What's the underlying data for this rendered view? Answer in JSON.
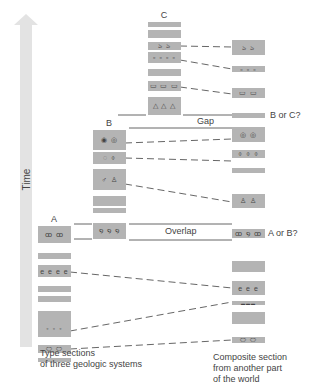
{
  "axis": {
    "time_label": "Time",
    "arrow_color": "#e3e3e3"
  },
  "colors": {
    "block": "#b4b4b4",
    "line": "#555555",
    "text": "#444444"
  },
  "columns": {
    "C": {
      "label": "C",
      "blocks": [
        {
          "top": 22,
          "height": 5,
          "fossil": ""
        },
        {
          "top": 30,
          "height": 8,
          "fossil": ""
        },
        {
          "top": 42,
          "height": 8,
          "fossil": "ঌ ঌ"
        },
        {
          "top": 52,
          "height": 11,
          "fossil": "▫ ▫ ▫ ▫"
        },
        {
          "top": 69,
          "height": 7,
          "fossil": ""
        },
        {
          "top": 81,
          "height": 10,
          "fossil": "▭ ▭ ▭"
        },
        {
          "top": 97,
          "height": 18,
          "fossil": "△ △ △"
        }
      ]
    },
    "B": {
      "label": "B",
      "blocks": [
        {
          "top": 130,
          "height": 20,
          "fossil": "◉ ◎"
        },
        {
          "top": 152,
          "height": 12,
          "fossil": "◌ ⌽"
        },
        {
          "top": 169,
          "height": 21,
          "fossil": "♂ ♙"
        },
        {
          "top": 196,
          "height": 10,
          "fossil": ""
        },
        {
          "top": 208,
          "height": 5,
          "fossil": ""
        },
        {
          "top": 223,
          "height": 16,
          "fossil": "໑ ໑ ໑"
        }
      ]
    },
    "A": {
      "label": "A",
      "blocks": [
        {
          "top": 226,
          "height": 17,
          "fossil": "ꝏ ꝏ"
        },
        {
          "top": 253,
          "height": 6,
          "fossil": ""
        },
        {
          "top": 265,
          "height": 12,
          "fossil": "e e e e"
        },
        {
          "top": 286,
          "height": 6,
          "fossil": ""
        },
        {
          "top": 296,
          "height": 6,
          "fossil": ""
        },
        {
          "top": 311,
          "height": 26,
          "fossil": "◦ ◦ ◦"
        },
        {
          "top": 345,
          "height": 8,
          "fossil": "⬭ ⬭"
        },
        {
          "top": 358,
          "height": 4,
          "fossil": ""
        }
      ]
    },
    "composite": {
      "blocks": [
        {
          "top": 40,
          "height": 15,
          "fossil": "ঌ ঌ"
        },
        {
          "top": 66,
          "height": 6,
          "fossil": "▫ ▫ ▫"
        },
        {
          "top": 88,
          "height": 10,
          "fossil": "▭ ▭"
        },
        {
          "top": 113,
          "height": 5,
          "fossil": ""
        },
        {
          "top": 127,
          "height": 15,
          "fossil": "◎ ◎"
        },
        {
          "top": 150,
          "height": 8,
          "fossil": "⌽ ⌽ ⌽"
        },
        {
          "top": 168,
          "height": 5,
          "fossil": ""
        },
        {
          "top": 194,
          "height": 14,
          "fossil": "♙ ♙"
        },
        {
          "top": 229,
          "height": 9,
          "fossil": "ꝏ ໑ ꝏ"
        },
        {
          "top": 261,
          "height": 11,
          "fossil": ""
        },
        {
          "top": 281,
          "height": 14,
          "fossil": "e e e"
        },
        {
          "top": 301,
          "height": 4,
          "fossil": "▬▬▬"
        },
        {
          "top": 312,
          "height": 12,
          "fossil": ""
        },
        {
          "top": 337,
          "height": 6,
          "fossil": "⬭ ⬭"
        }
      ]
    }
  },
  "annotations": {
    "gap": "Gap",
    "overlap": "Overlap",
    "b_or_c": "B or C?",
    "a_or_b": "A or B?"
  },
  "captions": {
    "type_sections_line1": "Type sections",
    "type_sections_line2": "of three geologic systems",
    "composite_line1": "Composite section",
    "composite_line2": "from another part",
    "composite_line3": "of the world"
  }
}
